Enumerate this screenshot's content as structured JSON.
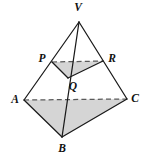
{
  "figure": {
    "type": "geometry-diagram",
    "canvas": {
      "width": 148,
      "height": 159
    },
    "colors": {
      "background": "#ffffff",
      "shade_fill": "#d5d5d5",
      "solid_edge": "#1a1a1a",
      "dashed_edge": "#5a5a5a",
      "label_text": "#111111"
    },
    "vertices": [
      {
        "name": "V",
        "label": "V",
        "x": 79,
        "y": 22,
        "label_x": 78,
        "label_y": 11
      },
      {
        "name": "P",
        "label": "P",
        "x": 52,
        "y": 62,
        "label_x": 42,
        "label_y": 62
      },
      {
        "name": "R",
        "label": "R",
        "x": 103,
        "y": 61,
        "label_x": 112,
        "label_y": 62
      },
      {
        "name": "Q",
        "label": "Q",
        "x": 68,
        "y": 78,
        "label_x": 73,
        "label_y": 90
      },
      {
        "name": "A",
        "label": "A",
        "x": 24,
        "y": 100,
        "label_x": 15,
        "label_y": 103
      },
      {
        "name": "C",
        "label": "C",
        "x": 127,
        "y": 99,
        "label_x": 135,
        "label_y": 102
      },
      {
        "name": "B",
        "label": "B",
        "x": 62,
        "y": 137,
        "label_x": 62,
        "label_y": 152
      }
    ],
    "shaded_faces": [
      {
        "name": "cross-section-pqr",
        "points": "52,62 103,61 68,78"
      },
      {
        "name": "base-abc",
        "points": "24,100 127,99 62,137"
      }
    ],
    "solid_edges": [
      {
        "name": "edge-v-a",
        "from": "V",
        "to": "A"
      },
      {
        "name": "edge-v-c",
        "from": "V",
        "to": "C"
      },
      {
        "name": "edge-v-b",
        "from": "V",
        "to": "B"
      },
      {
        "name": "edge-a-b",
        "from": "A",
        "to": "B"
      },
      {
        "name": "edge-b-c",
        "from": "B",
        "to": "C"
      },
      {
        "name": "edge-p-q",
        "from": "P",
        "to": "Q"
      },
      {
        "name": "edge-q-r",
        "from": "Q",
        "to": "R"
      }
    ],
    "dashed_edges": [
      {
        "name": "edge-a-c",
        "from": "A",
        "to": "C"
      },
      {
        "name": "edge-p-r",
        "from": "P",
        "to": "R"
      }
    ]
  }
}
